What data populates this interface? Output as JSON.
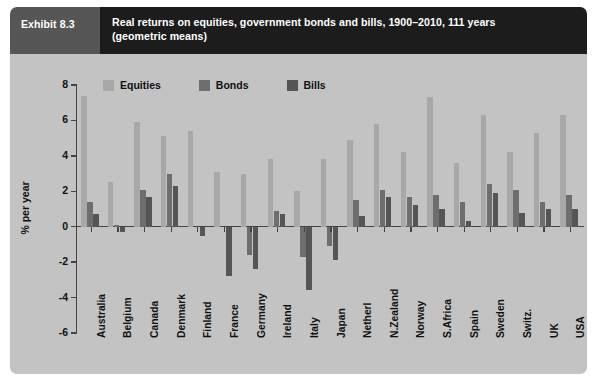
{
  "header": {
    "exhibit_label": "Exhibit 8.3",
    "title_line1": "Real returns on equities, government bonds and bills, 1900–2010, 111 years",
    "title_line2": "(geometric means)",
    "exhibit_bg": "#565656",
    "title_bg": "#1c1c1c",
    "text_color": "#ffffff"
  },
  "panel": {
    "background": "#c3c3c3",
    "axis_color": "#444444"
  },
  "chart_data": {
    "type": "bar",
    "title": "Real returns on equities, government bonds and bills, 1900–2010, 111 years (geometric means)",
    "xlabel": "",
    "ylabel": "% per year",
    "ylim": [
      -6,
      8
    ],
    "yticks": [
      8,
      6,
      4,
      2,
      0,
      -2,
      -4,
      -6
    ],
    "ytick_labels": [
      "8",
      "6",
      "4",
      "2",
      "0",
      "-2",
      "-4",
      "-6"
    ],
    "grid": false,
    "legend_position": "top-left",
    "categories": [
      "Australia",
      "Belgium",
      "Canada",
      "Denmark",
      "Finland",
      "France",
      "Germany",
      "Ireland",
      "Italy",
      "Japan",
      "Netherl",
      "N.Zealand",
      "Norway",
      "S.Africa",
      "Spain",
      "Sweden",
      "Switz.",
      "UK",
      "USA"
    ],
    "series": [
      {
        "name": "Equities",
        "color": "#a8a8a8",
        "values": [
          7.4,
          2.5,
          5.9,
          5.1,
          5.4,
          3.1,
          3.0,
          3.8,
          2.0,
          3.8,
          4.9,
          5.8,
          4.2,
          7.3,
          3.6,
          6.3,
          4.2,
          5.3,
          6.3
        ]
      },
      {
        "name": "Bonds",
        "color": "#6e6e6e",
        "values": [
          1.4,
          0.1,
          2.1,
          3.0,
          0.0,
          0.0,
          -1.6,
          0.9,
          -1.7,
          -1.1,
          1.5,
          2.1,
          1.7,
          1.8,
          1.4,
          2.4,
          2.1,
          1.4,
          1.8
        ]
      },
      {
        "name": "Bills",
        "color": "#555555",
        "values": [
          0.7,
          -0.3,
          1.7,
          2.3,
          -0.5,
          -2.8,
          -2.4,
          0.7,
          -3.6,
          -1.9,
          0.6,
          1.7,
          1.2,
          1.0,
          0.3,
          1.9,
          0.8,
          1.0,
          1.0
        ]
      }
    ]
  }
}
